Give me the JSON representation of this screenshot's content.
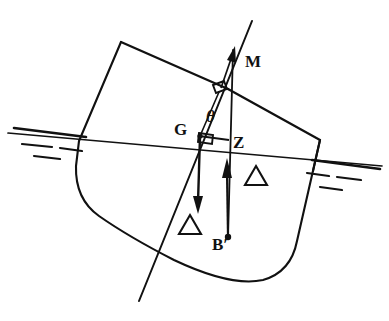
{
  "figure": {
    "domain": "naval-architecture-stability-diagram",
    "background_color": "#ffffff",
    "ink_color": "#111111",
    "width": 389,
    "height": 321
  },
  "labels": {
    "metacentre": "M",
    "centre_of_gravity": "G",
    "righting_arm_point": "Z",
    "centre_of_buoyancy": "B′",
    "heel_angle": "θ",
    "weight_force": "△",
    "buoyancy_force": "△"
  },
  "label_positions": {
    "metacentre": {
      "x": 246,
      "y": 62
    },
    "centre_of_gravity": {
      "x": 176,
      "y": 135
    },
    "righting_arm_point": {
      "x": 234,
      "y": 146
    },
    "centre_of_buoyancy": {
      "x": 215,
      "y": 245
    },
    "heel_angle": {
      "x": 208,
      "y": 119
    },
    "weight_delta": {
      "x": 191,
      "y": 230
    },
    "buoyancy_delta": {
      "x": 250,
      "y": 185
    }
  },
  "geometry": {
    "hull_outline": "M 121,42 L 79,141 L 76,163 Q 75,196 97,213 Q 126,234 172,258 Q 230,285 262,281 Q 290,275 297,243 L 320,140 L 228,89 Z",
    "deck_line": "M 121,42 L 228,89",
    "sheer_line": "M 228,89 L 320,140",
    "waterline_main": "M 10,134 L 380,166",
    "water_marks_left": [
      "M 14,128 L 86,137",
      "M 20,143 L 56,147",
      "M 62,147 L 84,150",
      "M 34,155 L 62,158"
    ],
    "water_marks_right": [
      "M 310,160 L 378,168",
      "M 306,172 L 330,175",
      "M 338,176 L 362,179",
      "M 320,186 L 342,189"
    ],
    "inclined_centreline": "M 251,22 L 140,300",
    "vertical_through_B": "M 224,47 L 228,243",
    "gz_line": "M 199,138 L 228,142",
    "right_angle_box": {
      "x": 198,
      "y": 131,
      "w": 14,
      "h": 9,
      "rotate": 9
    },
    "upper_right_angle_box": {
      "x": 214,
      "y": 83,
      "w": 11,
      "h": 8,
      "rotate": 23
    },
    "weight_arrow": {
      "x1": 200,
      "y1": 137,
      "x2": 198,
      "y2": 213
    },
    "buoyancy_arrow": {
      "x1": 227,
      "y1": 236,
      "x2": 226,
      "y2": 160
    },
    "m_arrow": {
      "x1": 222,
      "y1": 88,
      "x2": 234,
      "y2": 48
    },
    "b_dot": {
      "cx": 227,
      "cy": 237,
      "r": 3
    },
    "g_dot": {
      "cx": 200,
      "cy": 137,
      "r": 2.5
    }
  },
  "annotations": {
    "heel_angle_description": "Angle of heel θ between upright centreline and inclined centreline",
    "gz_description": "GZ is the righting lever between the weight acting down at G and buoyancy acting up through B′",
    "delta_description": "Δ denotes displacement (weight and buoyancy force magnitude)"
  }
}
